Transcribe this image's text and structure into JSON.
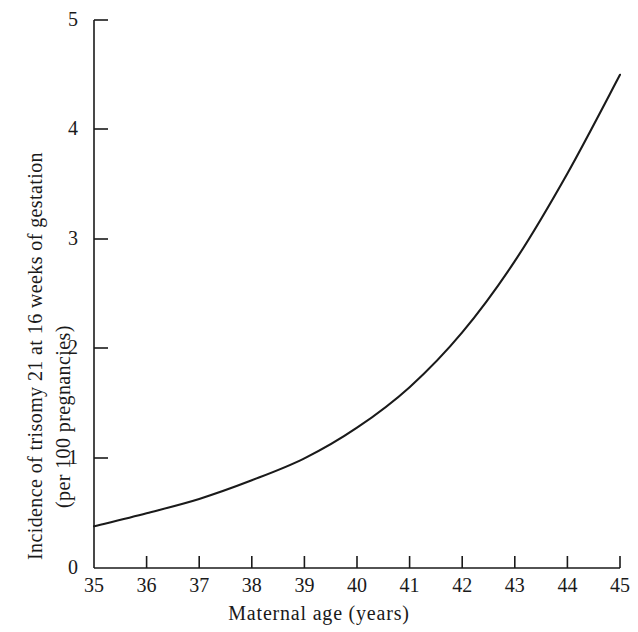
{
  "chart_data": {
    "type": "line",
    "title": "",
    "xlabel": "Maternal age (years)",
    "ylabel": "Incidence of trisomy 21 at 16 weeks of gestation (per 100 pregnancies)",
    "ylabel_line1": "Incidence of trisomy 21 at 16 weeks of gestation",
    "ylabel_line2": "(per 100 pregnancies)",
    "xlim": [
      35,
      45
    ],
    "ylim": [
      0,
      5
    ],
    "grid": false,
    "legend": "none",
    "x_tick_labels": [
      "35",
      "36",
      "37",
      "38",
      "39",
      "40",
      "41",
      "42",
      "43",
      "44",
      "45"
    ],
    "y_tick_labels": [
      "0",
      "1",
      "2",
      "3",
      "4",
      "5"
    ],
    "x": [
      35,
      36,
      37,
      38,
      39,
      40,
      41,
      42,
      43,
      44,
      45
    ],
    "values": [
      0.38,
      0.5,
      0.63,
      0.8,
      1.0,
      1.28,
      1.65,
      2.15,
      2.8,
      3.6,
      4.5
    ],
    "series": [
      {
        "name": "Incidence of trisomy 21",
        "values": [
          0.38,
          0.5,
          0.63,
          0.8,
          1.0,
          1.28,
          1.65,
          2.15,
          2.8,
          3.6,
          4.5
        ]
      }
    ],
    "line_color": "#1a1a1a",
    "axis_color": "#1a1a1a",
    "background_color": "#ffffff"
  }
}
